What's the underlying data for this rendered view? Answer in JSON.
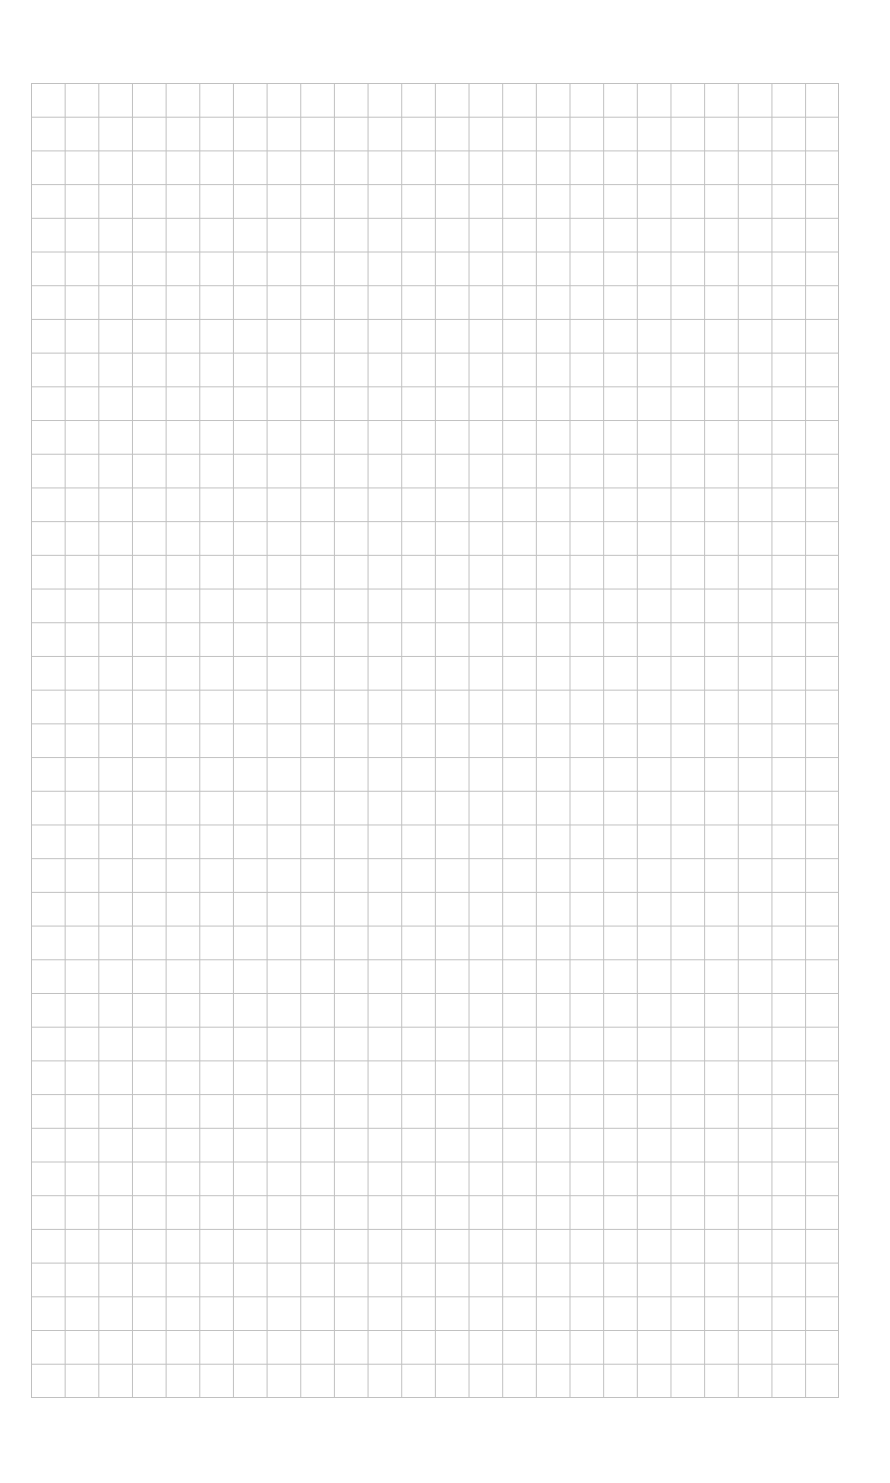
{
  "page": {
    "type": "graph-paper",
    "background_color": "#ffffff",
    "line_color": "#c0c0c0"
  },
  "grid": {
    "left": 31,
    "top": 83,
    "width": 808,
    "height": 1315,
    "columns": 24,
    "rows": 39
  }
}
